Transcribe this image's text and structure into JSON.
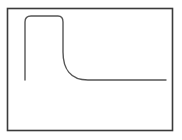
{
  "diagram": {
    "type": "waveform-sketch",
    "colors": {
      "background": "#ffffff",
      "frame": "#3a3a3a",
      "curve": "#555555"
    },
    "frame": {
      "x": 7.5,
      "y": 8.5,
      "width": 165,
      "height": 122
    },
    "curve_path": "M 25 80 L 25 22 Q 25 16 31 16 L 58 16 Q 63 16 63 22 L 63 52 C 63 68 70 80 88 80 L 166 80"
  }
}
